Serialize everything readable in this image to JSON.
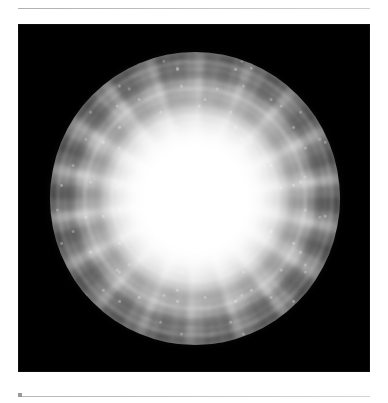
{
  "page": {
    "background_color": "#ffffff",
    "width": 388,
    "height": 403
  },
  "running_head": {
    "text_left": "",
    "text_right": "",
    "note": "running head cropped at top edge, illegible",
    "color": "#d6d6d6"
  },
  "rules": {
    "top": {
      "name": "top-separator-rule",
      "color": "#b9b9b9"
    },
    "bottom": {
      "name": "bottom-separator-rule",
      "color": "#c2c2c2"
    },
    "bottom_tick": {
      "name": "bottom-rule-tick",
      "color": "#9a9a9a"
    }
  },
  "figure": {
    "name": "sphere-visualization",
    "caption": "",
    "panel_background": "#000000",
    "colormap": "grayscale",
    "core_color": "#ffffff",
    "midtone_color": "#8a8a8a",
    "shadow_color": "#3a3a3a",
    "symmetry_order": 18,
    "shell_count": 4
  }
}
